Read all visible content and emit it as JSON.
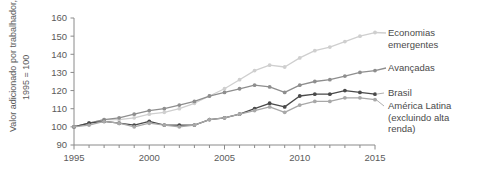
{
  "chart_data": {
    "type": "line",
    "title": "",
    "subtitle": "",
    "xlabel": "",
    "ylabel": "Valor adicionado por trabalhador, 1995 = 100",
    "ylabel_line1": "Valor adicionado por trabalhador,",
    "ylabel_line2": "1995 = 100",
    "xlim": [
      1995,
      2015
    ],
    "ylim": [
      90,
      160
    ],
    "ytick_values": [
      90,
      100,
      110,
      120,
      130,
      140,
      150,
      160
    ],
    "ytick_labels": [
      "90",
      "100",
      "110",
      "120",
      "130",
      "140",
      "150",
      "160"
    ],
    "xtick_values": [
      1995,
      1996,
      1997,
      1998,
      1999,
      2000,
      2001,
      2002,
      2003,
      2004,
      2005,
      2006,
      2007,
      2008,
      2009,
      2010,
      2011,
      2012,
      2013,
      2014,
      2015
    ],
    "xtick_labels_shown": [
      "1995",
      "2000",
      "2005",
      "2010",
      "2015"
    ],
    "xtick_labeled_values": [
      1995,
      2000,
      2005,
      2010,
      2015
    ],
    "grid": false,
    "legend_position": "right-inline",
    "markers": true,
    "x": [
      1995,
      1996,
      1997,
      1998,
      1999,
      2000,
      2001,
      2002,
      2003,
      2004,
      2005,
      2006,
      2007,
      2008,
      2009,
      2010,
      2011,
      2012,
      2013,
      2014,
      2015
    ],
    "series": [
      {
        "name": "Economias emergentes",
        "label_line1": "Economias",
        "label_line2": "emergentes",
        "color": "#cfcfcf",
        "values": [
          100,
          102,
          104,
          104,
          105,
          107,
          108,
          110,
          113,
          117,
          121,
          126,
          131,
          134,
          133,
          138,
          142,
          144,
          147,
          150,
          152
        ]
      },
      {
        "name": "Avançadas",
        "label_line1": "Avançadas",
        "label_line2": "",
        "color": "#8e8e8e",
        "values": [
          100,
          102,
          104,
          105,
          107,
          109,
          110,
          112,
          114,
          117,
          119,
          121,
          123,
          122,
          119,
          123,
          125,
          126,
          128,
          130,
          131
        ]
      },
      {
        "name": "Brasil",
        "label_line1": "Brasil",
        "label_line2": "",
        "color": "#4a4a4a",
        "values": [
          100,
          102,
          103,
          102,
          101,
          103,
          101,
          101,
          101,
          104,
          105,
          107,
          110,
          113,
          111,
          117,
          118,
          118,
          120,
          119,
          118
        ]
      },
      {
        "name": "América Latina (excluindo alta renda)",
        "label_line1": "América Latina",
        "label_line2": "(excluindo alta",
        "label_line3": "renda)",
        "color": "#a8a8a8",
        "values": [
          100,
          101,
          103,
          102,
          100,
          102,
          101,
          100,
          101,
          104,
          105,
          107,
          109,
          111,
          108,
          112,
          114,
          114,
          116,
          116,
          115
        ]
      }
    ]
  }
}
